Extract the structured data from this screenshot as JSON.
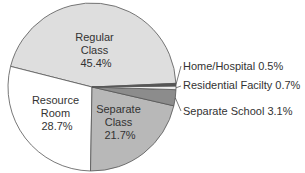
{
  "chart_data": {
    "type": "pie",
    "title": "",
    "slices": [
      {
        "label": "Regular Class",
        "value": 45.4,
        "display": "45.4%",
        "color": "#dedede"
      },
      {
        "label": "Resource Room",
        "value": 28.7,
        "display": "28.7%",
        "color": "#ffffff"
      },
      {
        "label": "Separate Class",
        "value": 21.7,
        "display": "21.7%",
        "color": "#b8b8b8"
      },
      {
        "label": "Separate School",
        "value": 3.1,
        "display": "3.1%",
        "color": "#8c8c8c"
      },
      {
        "label": "Residential Facilty",
        "value": 0.7,
        "display": "0.7%",
        "color": "#ededed"
      },
      {
        "label": "Home/Hospital",
        "value": 0.5,
        "display": "0.5%",
        "color": "#555555"
      }
    ],
    "inside_labels": [
      {
        "lines": [
          "Regular",
          "Class",
          "45.4%"
        ]
      },
      {
        "lines": [
          "Resource",
          "Room",
          "28.7%"
        ]
      },
      {
        "lines": [
          "Separate",
          "Class",
          "21.7%"
        ]
      }
    ],
    "callout_labels": [
      {
        "text": "Home/Hospital 0.5%"
      },
      {
        "text": "Residential Facilty 0.7%"
      },
      {
        "text": "Separate School 3.1%"
      }
    ],
    "legend": "none"
  }
}
